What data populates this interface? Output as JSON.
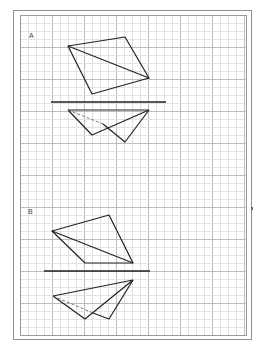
{
  "caption": "",
  "sheet": {
    "grid": {
      "left": 20,
      "top": 15,
      "right": 246,
      "bottom": 335,
      "minor_step": 8,
      "major_every": 4,
      "minor_color": "#e2e2e2",
      "major_color": "#bdbdbd",
      "border_color": "#9a9a9a"
    },
    "line_color": "#222222"
  },
  "figures": [
    {
      "label": "A",
      "label_pos": [
        29,
        32
      ],
      "plan": {
        "outline": [
          [
            68,
            46
          ],
          [
            125,
            37
          ],
          [
            149,
            78
          ],
          [
            92,
            94
          ]
        ],
        "diagonal": [
          [
            68,
            46
          ],
          [
            149,
            78
          ]
        ]
      },
      "ground_line": [
        [
          51,
          102
        ],
        [
          166,
          102
        ]
      ],
      "elevation": {
        "top_edge": [
          [
            68,
            110
          ],
          [
            149,
            110
          ]
        ],
        "solid_paths": [
          [
            [
              68,
              110
            ],
            [
              92,
              135
            ],
            [
              149,
              110
            ]
          ],
          [
            [
              149,
              110
            ],
            [
              125,
              142
            ],
            [
              103,
              124
            ]
          ]
        ],
        "dashed_paths": [
          [
            [
              68,
              110
            ],
            [
              103,
              124
            ]
          ]
        ]
      }
    },
    {
      "label": "B",
      "label_pos": [
        28,
        208
      ],
      "plan": {
        "outline": [
          [
            52,
            231
          ],
          [
            109,
            215
          ],
          [
            133,
            263
          ],
          [
            85,
            263
          ]
        ],
        "diagonal": [
          [
            52,
            231
          ],
          [
            133,
            263
          ]
        ]
      },
      "ground_line": [
        [
          44,
          271
        ],
        [
          150,
          271
        ]
      ],
      "elevation": {
        "top_edge": [
          [
            53,
            296
          ],
          [
            133,
            280
          ]
        ],
        "solid_paths": [
          [
            [
              53,
              296
            ],
            [
              85,
              319
            ],
            [
              133,
              280
            ]
          ],
          [
            [
              133,
              280
            ],
            [
              109,
              319
            ],
            [
              93,
              313
            ]
          ]
        ],
        "dashed_paths": [
          [
            [
              53,
              296
            ],
            [
              93,
              313
            ]
          ]
        ]
      }
    }
  ]
}
